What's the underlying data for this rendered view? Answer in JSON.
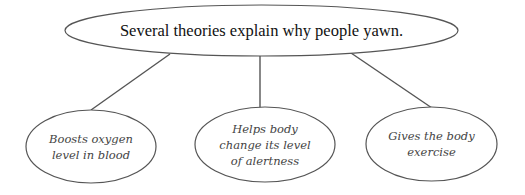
{
  "diagram": {
    "type": "concept-map",
    "root": {
      "text": "Several theories explain why people yawn."
    },
    "children": [
      {
        "lines": [
          "Boosts oxygen",
          "level in blood"
        ]
      },
      {
        "lines": [
          "Helps body",
          "change its level",
          "of alertness"
        ]
      },
      {
        "lines": [
          "Gives the body",
          "exercise"
        ]
      }
    ],
    "colors": {
      "stroke": "#555555",
      "root_text": "#111111",
      "child_text": "#444444",
      "background": "#ffffff"
    }
  }
}
